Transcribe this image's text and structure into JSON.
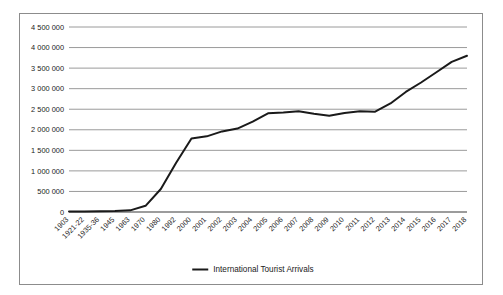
{
  "chart_data": {
    "type": "line",
    "title": "",
    "subtitle": "",
    "xlabel": "",
    "ylabel": "",
    "grid": true,
    "legend_position": "bottom-center",
    "ylim": [
      0,
      4500000
    ],
    "ytick_step": 500000,
    "ytick_labels": [
      "4 500 000",
      "4 000 000",
      "3 500 000",
      "3 000 000",
      "2 500 000",
      "2 000 000",
      "1 500 000",
      "1 000 000",
      "500 000",
      "0"
    ],
    "ytick_values": [
      4500000,
      4000000,
      3500000,
      3000000,
      2500000,
      2000000,
      1500000,
      1000000,
      500000,
      0
    ],
    "categories": [
      "1903",
      "1921-22",
      "1935-36",
      "1945",
      "1963",
      "1970",
      "1980",
      "1992",
      "2000",
      "2001",
      "2002",
      "2003",
      "2004",
      "2005",
      "2006",
      "2007",
      "2008",
      "2009",
      "2010",
      "2011",
      "2012",
      "2013",
      "2014",
      "2015",
      "2016",
      "2017",
      "2018"
    ],
    "series": [
      {
        "name": "International Tourist Arrivals",
        "color": "#1a1a1a",
        "values": [
          10000,
          15000,
          20000,
          25000,
          40000,
          150000,
          560000,
          1200000,
          1790000,
          1840000,
          1960000,
          2030000,
          2200000,
          2400000,
          2420000,
          2450000,
          2390000,
          2340000,
          2410000,
          2450000,
          2440000,
          2640000,
          2920000,
          3150000,
          3400000,
          3650000,
          3800000
        ]
      }
    ],
    "legend": [
      {
        "label": "International Tourist Arrivals",
        "marker": "line",
        "color": "#1a1a1a"
      }
    ]
  },
  "figure": {
    "border_color": "#8c8c8c",
    "background": "#ffffff",
    "gridline_color": "#8f8f8f",
    "axis_color": "#3a3a3a"
  }
}
